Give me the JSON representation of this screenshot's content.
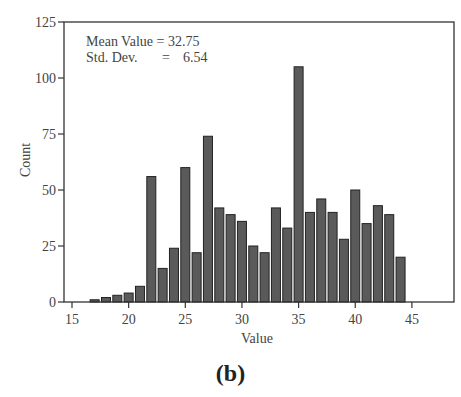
{
  "chart_data": {
    "type": "bar",
    "title": "",
    "xlabel": "Value",
    "ylabel": "Count",
    "xlim": [
      13.8,
      48.3
    ],
    "ylim": [
      0,
      125
    ],
    "xticks": [
      15,
      20,
      25,
      30,
      35,
      40,
      45
    ],
    "yticks": [
      0,
      25,
      50,
      75,
      100,
      125
    ],
    "grid": false,
    "legend": null,
    "bar_color": "#5a5a5a",
    "bar_edge_color": "#222222",
    "x": [
      17,
      18,
      19,
      20,
      21,
      22,
      23,
      24,
      25,
      26,
      27,
      28,
      29,
      30,
      31,
      32,
      33,
      34,
      35,
      36,
      37,
      38,
      39,
      40,
      41,
      42,
      43,
      44
    ],
    "values": [
      1,
      2,
      3,
      4,
      7,
      56,
      15,
      24,
      60,
      22,
      74,
      42,
      39,
      36,
      25,
      22,
      42,
      33,
      105,
      40,
      46,
      40,
      28,
      50,
      35,
      43,
      39,
      20
    ],
    "annotations": [
      "Mean Value = 32.75",
      "Std. Dev.      =   6.54"
    ]
  },
  "annotation": {
    "mean_label": "Mean Value = 32.75",
    "std_label": "Std. Dev.",
    "std_eq": "=",
    "std_value": "6.54"
  },
  "caption": "(b)"
}
